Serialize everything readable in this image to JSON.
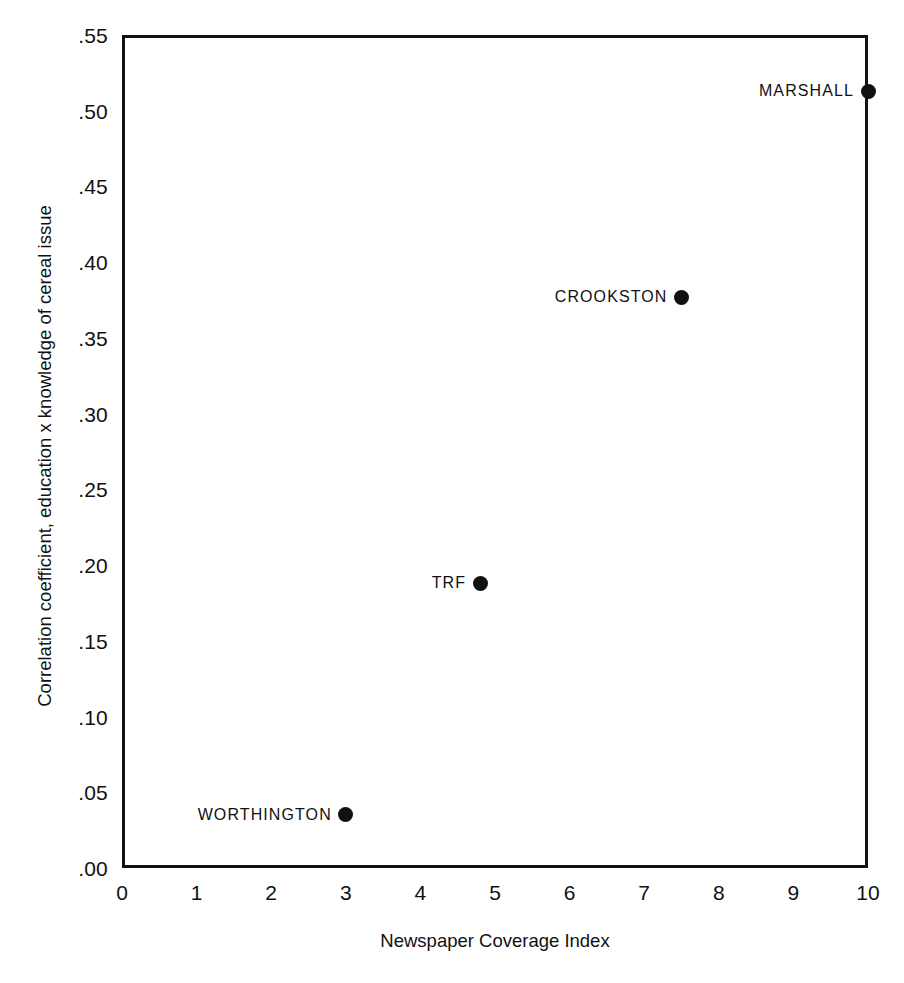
{
  "chart_data": {
    "type": "scatter",
    "title": "",
    "xlabel": "Newspaper Coverage Index",
    "ylabel": "Correlation coefficient, education x knowledge of cereal issue",
    "xlim": [
      0,
      10
    ],
    "ylim": [
      0.0,
      0.55
    ],
    "grid": false,
    "legend": "none",
    "x_ticks": [
      "0",
      "1",
      "2",
      "3",
      "4",
      "5",
      "6",
      "7",
      "8",
      "9",
      "10"
    ],
    "x_tick_values": [
      0,
      1,
      2,
      3,
      4,
      5,
      6,
      7,
      8,
      9,
      10
    ],
    "y_ticks": [
      ".55",
      ".50",
      ".45",
      ".40",
      ".35",
      ".30",
      ".25",
      ".20",
      ".15",
      ".10",
      ".05",
      ".00"
    ],
    "y_tick_values": [
      0.55,
      0.5,
      0.45,
      0.4,
      0.35,
      0.3,
      0.25,
      0.2,
      0.15,
      0.1,
      0.05,
      0.0
    ],
    "points": [
      {
        "label": "MARSHALL",
        "x": 10.0,
        "y": 0.513
      },
      {
        "label": "CROOKSTON",
        "x": 7.5,
        "y": 0.377
      },
      {
        "label": "TRF",
        "x": 4.8,
        "y": 0.188
      },
      {
        "label": "WORTHINGTON",
        "x": 3.0,
        "y": 0.035
      }
    ],
    "marker": "filled-circle",
    "marker_color": "#111111",
    "axis_color": "#111111",
    "background_color": "#ffffff"
  }
}
